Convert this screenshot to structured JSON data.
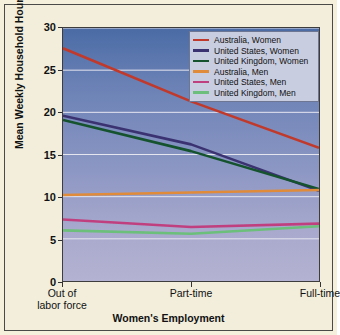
{
  "chart_data": {
    "type": "line",
    "title": "",
    "xlabel": "Women's Employment",
    "ylabel": "Mean Weekly Household Hours",
    "categories": [
      "Out of labor force",
      "Part-time",
      "Full-time"
    ],
    "category_labels": [
      {
        "line1": "Out of",
        "line2": "labor force"
      },
      {
        "line1": "Part-time",
        "line2": ""
      },
      {
        "line1": "Full-time",
        "line2": ""
      }
    ],
    "ylim": [
      0,
      30
    ],
    "yticks": [
      0,
      5,
      10,
      15,
      20,
      25,
      30
    ],
    "ytick_labels": [
      "0",
      "5",
      "10",
      "15",
      "20",
      "25",
      "30"
    ],
    "grid": true,
    "legend_position": "top-right",
    "series": [
      {
        "name": "Australia, Women",
        "color": "#c0392b",
        "values": [
          27.6,
          21.3,
          15.8
        ]
      },
      {
        "name": "United States, Women",
        "color": "#3b3272",
        "values": [
          19.6,
          16.2,
          10.7
        ]
      },
      {
        "name": "United Kingdom, Women",
        "color": "#14532d",
        "values": [
          19.1,
          15.4,
          10.9
        ]
      },
      {
        "name": "Australia, Men",
        "color": "#e08b3a",
        "values": [
          10.2,
          10.5,
          10.8
        ]
      },
      {
        "name": "United States, Men",
        "color": "#c0407f",
        "values": [
          7.3,
          6.4,
          6.8
        ]
      },
      {
        "name": "United Kingdom, Men",
        "color": "#6cbf7a",
        "values": [
          6.0,
          5.6,
          6.5
        ]
      }
    ]
  },
  "colors": {
    "page_background": "#f2eedb",
    "frame_border": "#4a4a48",
    "plot_top": "#4a6ba5",
    "plot_bottom": "#b4b2d2",
    "gridline": "#e6e6f0",
    "legend_background": "#c8cde0",
    "legend_border": "#6d7793",
    "text": "#111111"
  }
}
